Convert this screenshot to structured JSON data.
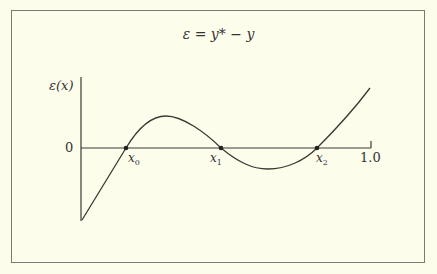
{
  "figure": {
    "title": "ε = y* − y",
    "y_axis_label": "ε(x)",
    "y_tick_label": "0",
    "x_end_label": "1.0",
    "roots": [
      {
        "base": "x",
        "sub": "0"
      },
      {
        "base": "x",
        "sub": "1"
      },
      {
        "base": "x",
        "sub": "2"
      }
    ],
    "curve_description": "Error curve starting negative at x=0, crossing zero at x0, local max, crossing at x1, local min, crossing at x2, rising to x=1.0",
    "colors": {
      "background": "#fdfdec",
      "ink": "#3a3a34",
      "frame": "#7a7a72"
    }
  }
}
